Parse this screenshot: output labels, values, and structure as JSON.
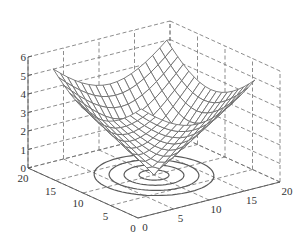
{
  "chart_data": {
    "type": "surface3d",
    "title": "",
    "xlabel": "",
    "ylabel": "",
    "zlabel": "",
    "function": "z = 0.48 * sqrt((x-10)^2 + (y-10)^2)",
    "x_range": [
      2,
      18
    ],
    "y_range": [
      2,
      18
    ],
    "grid_steps": 16,
    "z_range": [
      0,
      6
    ],
    "x_ticks": [
      0,
      5,
      10,
      15,
      20
    ],
    "y_ticks": [
      0,
      5,
      10,
      15,
      20
    ],
    "z_ticks": [
      0,
      1,
      2,
      3,
      4,
      5,
      6
    ],
    "contour_levels": [
      1,
      2,
      3,
      4
    ],
    "contour_center": [
      10,
      10
    ],
    "contour_projected_on": "z=0",
    "corner_heights_approx": 5.4,
    "grid": true,
    "box": "dashed",
    "colors": {
      "mesh": "#6e6e6e",
      "axis": "#555555",
      "grid": "#707070",
      "contour": "#5a5a5a",
      "face": "#ffffff"
    }
  },
  "projection": {
    "origin": [
      138,
      218
    ],
    "ex": [
      7.1,
      -1.8
    ],
    "ey": [
      -5.5,
      -2.5
    ],
    "ez": [
      0,
      -18.5
    ]
  }
}
